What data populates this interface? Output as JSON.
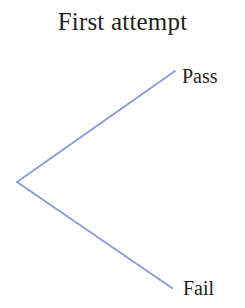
{
  "diagram": {
    "title": "First attempt",
    "type": "probability-tree",
    "background_color": "#ffffff",
    "text_color": "#231f20",
    "branch_color": "#8b9bd9",
    "branch_width": 2,
    "root": {
      "name": "first-attempt-node",
      "x": 17,
      "y": 182
    },
    "branches": [
      {
        "name": "pass-branch",
        "label": "Pass",
        "from_x": 17,
        "from_y": 182,
        "to_x": 175,
        "to_y": 71
      },
      {
        "name": "fail-branch",
        "label": "Fail",
        "from_x": 17,
        "from_y": 182,
        "to_x": 172,
        "to_y": 288
      }
    ]
  },
  "labels": {
    "pass": "Pass",
    "fail": "Fail"
  }
}
